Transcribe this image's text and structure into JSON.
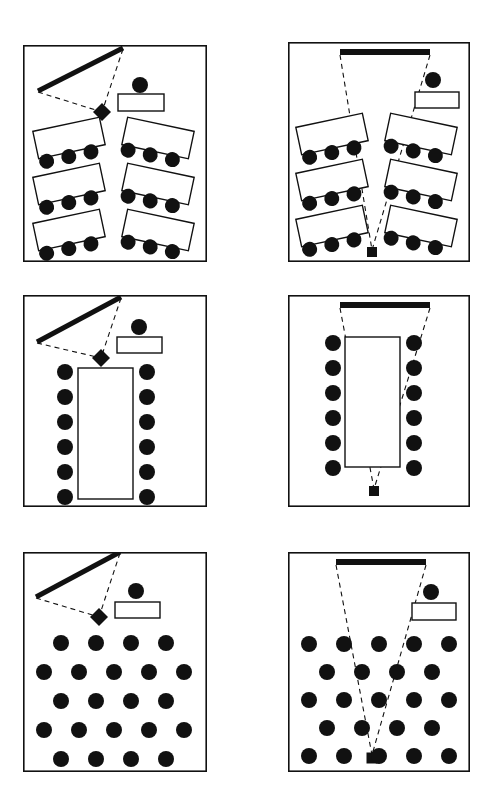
{
  "figure": {
    "caption": "",
    "width": 498,
    "height": 789,
    "style": {
      "ink": "#111111",
      "paper": "#ffffff",
      "border_width": 1.6,
      "seat_fill": "#111111",
      "table_fill": "#ffffff",
      "dash_pattern": "5 4"
    }
  },
  "panels": [
    {
      "id": "panel-1",
      "name": "classroom-angled-tables-flipchart",
      "x": 23,
      "y": 45,
      "w": 184,
      "h": 217,
      "display_device": {
        "type": "flipchart-board",
        "orientation": "diagonal",
        "x1": 100,
        "y1": 3,
        "x2": 15,
        "y2": 46,
        "thickness": 5
      },
      "projector": {
        "type": "diamond",
        "cx": 79,
        "cy": 67,
        "size": 9
      },
      "sight_lines": [
        {
          "x1": 100,
          "y1": 4,
          "x2": 79,
          "y2": 67
        },
        {
          "x1": 15,
          "y1": 47,
          "x2": 79,
          "y2": 67
        }
      ],
      "presenter": {
        "cx": 117,
        "cy": 40,
        "r": 8
      },
      "lectern": {
        "x": 95,
        "y": 49,
        "w": 46,
        "h": 17
      },
      "tables": [
        {
          "x": 12,
          "y": 79,
          "w": 68,
          "h": 28,
          "rotate": -12,
          "seats": 3,
          "seat_side": "bottom"
        },
        {
          "x": 12,
          "y": 125,
          "w": 68,
          "h": 28,
          "rotate": -12,
          "seats": 3,
          "seat_side": "bottom"
        },
        {
          "x": 12,
          "y": 171,
          "w": 68,
          "h": 28,
          "rotate": -12,
          "seats": 3,
          "seat_side": "bottom"
        },
        {
          "x": 101,
          "y": 79,
          "w": 68,
          "h": 28,
          "rotate": 12,
          "seats": 3,
          "seat_side": "bottom"
        },
        {
          "x": 101,
          "y": 125,
          "w": 68,
          "h": 28,
          "rotate": 12,
          "seats": 3,
          "seat_side": "bottom"
        },
        {
          "x": 101,
          "y": 171,
          "w": 68,
          "h": 28,
          "rotate": 12,
          "seats": 3,
          "seat_side": "bottom"
        }
      ],
      "seat_count": 18,
      "seat_radius": 7.5
    },
    {
      "id": "panel-2",
      "name": "classroom-angled-tables-projection-screen",
      "x": 288,
      "y": 42,
      "w": 182,
      "h": 220,
      "display_device": {
        "type": "projection-screen",
        "orientation": "horizontal",
        "x1": 52,
        "y1": 10,
        "x2": 142,
        "y2": 10,
        "thickness": 6
      },
      "projector": {
        "type": "square",
        "cx": 84,
        "cy": 210,
        "size": 10
      },
      "sight_lines": [
        {
          "x1": 52,
          "y1": 13,
          "x2": 84,
          "y2": 208
        },
        {
          "x1": 142,
          "y1": 13,
          "x2": 84,
          "y2": 208
        }
      ],
      "presenter": {
        "cx": 145,
        "cy": 38,
        "r": 8
      },
      "lectern": {
        "x": 127,
        "y": 50,
        "w": 44,
        "h": 16
      },
      "tables": [
        {
          "x": 10,
          "y": 78,
          "w": 68,
          "h": 28,
          "rotate": -12,
          "seats": 3,
          "seat_side": "bottom"
        },
        {
          "x": 10,
          "y": 124,
          "w": 68,
          "h": 28,
          "rotate": -12,
          "seats": 3,
          "seat_side": "bottom"
        },
        {
          "x": 10,
          "y": 170,
          "w": 68,
          "h": 28,
          "rotate": -12,
          "seats": 3,
          "seat_side": "bottom"
        },
        {
          "x": 99,
          "y": 78,
          "w": 68,
          "h": 28,
          "rotate": 12,
          "seats": 3,
          "seat_side": "bottom"
        },
        {
          "x": 99,
          "y": 124,
          "w": 68,
          "h": 28,
          "rotate": 12,
          "seats": 3,
          "seat_side": "bottom"
        },
        {
          "x": 99,
          "y": 170,
          "w": 68,
          "h": 28,
          "rotate": 12,
          "seats": 3,
          "seat_side": "bottom"
        }
      ],
      "seat_count": 18,
      "seat_radius": 7.5
    },
    {
      "id": "panel-3",
      "name": "boardroom-table-flipchart",
      "x": 23,
      "y": 295,
      "w": 184,
      "h": 212,
      "display_device": {
        "type": "flipchart-board",
        "orientation": "diagonal",
        "x1": 98,
        "y1": 2,
        "x2": 14,
        "y2": 47,
        "thickness": 5
      },
      "projector": {
        "type": "diamond",
        "cx": 78,
        "cy": 63,
        "size": 9
      },
      "sight_lines": [
        {
          "x1": 98,
          "y1": 3,
          "x2": 78,
          "y2": 63
        },
        {
          "x1": 14,
          "y1": 48,
          "x2": 78,
          "y2": 63
        }
      ],
      "presenter": {
        "cx": 116,
        "cy": 32,
        "r": 8
      },
      "lectern": {
        "x": 94,
        "y": 42,
        "w": 45,
        "h": 16
      },
      "tables": [
        {
          "x": 55,
          "y": 73,
          "w": 55,
          "h": 131,
          "rotate": 0,
          "seats": 0,
          "seat_side": "none"
        }
      ],
      "boardroom_seats": {
        "left_column_x": 42,
        "right_column_x": 124,
        "start_y": 77,
        "spacing": 25,
        "rows": 6,
        "radius": 8
      },
      "seat_count": 12,
      "seat_radius": 8
    },
    {
      "id": "panel-4",
      "name": "boardroom-table-projection-screen",
      "x": 288,
      "y": 295,
      "w": 182,
      "h": 212,
      "display_device": {
        "type": "projection-screen",
        "orientation": "horizontal",
        "x1": 52,
        "y1": 10,
        "x2": 142,
        "y2": 10,
        "thickness": 6
      },
      "projector": {
        "type": "square",
        "cx": 86,
        "cy": 196,
        "size": 10
      },
      "sight_lines": [
        {
          "x1": 52,
          "y1": 13,
          "x2": 86,
          "y2": 194
        },
        {
          "x1": 142,
          "y1": 13,
          "x2": 86,
          "y2": 194
        }
      ],
      "presenter": null,
      "lectern": null,
      "tables": [
        {
          "x": 57,
          "y": 42,
          "w": 55,
          "h": 130,
          "rotate": 0,
          "seats": 0,
          "seat_side": "none"
        }
      ],
      "boardroom_seats": {
        "left_column_x": 45,
        "right_column_x": 126,
        "start_y": 48,
        "spacing": 25,
        "rows": 6,
        "radius": 8
      },
      "seat_count": 12,
      "seat_radius": 8
    },
    {
      "id": "panel-5",
      "name": "theatre-seating-flipchart",
      "x": 23,
      "y": 552,
      "w": 184,
      "h": 220,
      "display_device": {
        "type": "flipchart-board",
        "orientation": "diagonal",
        "x1": 97,
        "y1": 0,
        "x2": 13,
        "y2": 45,
        "thickness": 5
      },
      "projector": {
        "type": "diamond",
        "cx": 76,
        "cy": 65,
        "size": 9
      },
      "sight_lines": [
        {
          "x1": 97,
          "y1": 1,
          "x2": 76,
          "y2": 65
        },
        {
          "x1": 13,
          "y1": 46,
          "x2": 76,
          "y2": 65
        }
      ],
      "presenter": {
        "cx": 113,
        "cy": 39,
        "r": 8
      },
      "lectern": {
        "x": 92,
        "y": 50,
        "w": 45,
        "h": 16
      },
      "tables": [],
      "theatre_rows": [
        {
          "count": 4,
          "start_x": 38,
          "spacing": 35,
          "y": 91
        },
        {
          "count": 5,
          "start_x": 21,
          "spacing": 35,
          "y": 120
        },
        {
          "count": 4,
          "start_x": 38,
          "spacing": 35,
          "y": 149
        },
        {
          "count": 5,
          "start_x": 21,
          "spacing": 35,
          "y": 178
        },
        {
          "count": 4,
          "start_x": 38,
          "spacing": 35,
          "y": 207
        }
      ],
      "seat_count": 22,
      "seat_radius": 8
    },
    {
      "id": "panel-6",
      "name": "theatre-seating-projection-screen",
      "x": 288,
      "y": 552,
      "w": 182,
      "h": 220,
      "display_device": {
        "type": "projection-screen",
        "orientation": "horizontal",
        "x1": 48,
        "y1": 10,
        "x2": 138,
        "y2": 10,
        "thickness": 6
      },
      "projector": {
        "type": "square",
        "cx": 84,
        "cy": 206,
        "size": 11
      },
      "sight_lines": [
        {
          "x1": 48,
          "y1": 13,
          "x2": 84,
          "y2": 203
        },
        {
          "x1": 138,
          "y1": 13,
          "x2": 84,
          "y2": 203
        }
      ],
      "presenter": {
        "cx": 143,
        "cy": 40,
        "r": 8
      },
      "lectern": {
        "x": 124,
        "y": 51,
        "w": 44,
        "h": 17
      },
      "tables": [],
      "theatre_rows": [
        {
          "count": 5,
          "start_x": 21,
          "spacing": 35,
          "y": 92
        },
        {
          "count": 4,
          "start_x": 39,
          "spacing": 35,
          "y": 120
        },
        {
          "count": 5,
          "start_x": 21,
          "spacing": 35,
          "y": 148
        },
        {
          "count": 4,
          "start_x": 39,
          "spacing": 35,
          "y": 176
        },
        {
          "count": 5,
          "start_x": 21,
          "spacing": 35,
          "y": 204
        }
      ],
      "seat_count": 23,
      "seat_radius": 8
    }
  ]
}
